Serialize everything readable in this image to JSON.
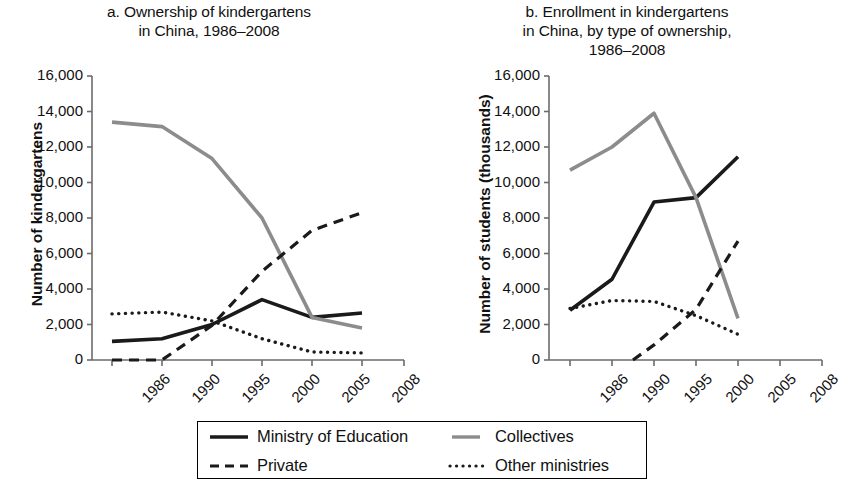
{
  "figure": {
    "background": "#ffffff",
    "colors": {
      "ministry_of_education": "#1a1a1a",
      "collectives": "#8c8c8c",
      "private": "#1a1a1a",
      "other_ministries": "#1a1a1a",
      "axis": "#6b6b6b",
      "text": "#111111"
    }
  },
  "legend": {
    "items": [
      {
        "label": "Ministry of Education",
        "style": "solid",
        "color": "#1a1a1a"
      },
      {
        "label": "Collectives",
        "style": "solid",
        "color": "#8c8c8c"
      },
      {
        "label": "Private",
        "style": "dashed",
        "color": "#1a1a1a"
      },
      {
        "label": "Other ministries",
        "style": "dotted",
        "color": "#1a1a1a"
      }
    ]
  },
  "chart_data": [
    {
      "type": "line",
      "panel": "a",
      "title": "a. Ownership of kindergartens\nin China, 1986–2008",
      "title_line1": "a. Ownership of kindergartens",
      "title_line2": "in China, 1986–2008",
      "xlabel": "",
      "ylabel": "Number of kindergartens",
      "x": [
        1986,
        1990,
        1995,
        2000,
        2005,
        2008
      ],
      "xtick_labels": [
        "1986",
        "1990",
        "1995",
        "2000",
        "2005",
        "2008"
      ],
      "ytick_labels": [
        "0",
        "2,000",
        "4,000",
        "6,000",
        "8,000",
        "10,000",
        "12,000",
        "14,000",
        "16,000"
      ],
      "ytick_values": [
        0,
        2000,
        4000,
        6000,
        8000,
        10000,
        12000,
        14000,
        16000
      ],
      "ylim": [
        0,
        16000
      ],
      "grid": false,
      "legend_position": "below-figure",
      "series": [
        {
          "name": "Ministry of Education",
          "style": "solid",
          "color": "#1a1a1a",
          "x": [
            1986,
            1990,
            1995,
            2000,
            2005,
            2008
          ],
          "values": [
            1050,
            1200,
            2000,
            3400,
            2400,
            2650
          ]
        },
        {
          "name": "Collectives",
          "style": "solid",
          "color": "#8c8c8c",
          "x": [
            1986,
            1990,
            1995,
            2000,
            2005,
            2008
          ],
          "values": [
            13400,
            13150,
            11350,
            8000,
            2400,
            1800
          ]
        },
        {
          "name": "Private",
          "style": "dashed",
          "color": "#1a1a1a",
          "x": [
            1986,
            1990,
            1995,
            2000,
            2005,
            2008
          ],
          "values": [
            0,
            0,
            1950,
            5000,
            7300,
            8300
          ]
        },
        {
          "name": "Other ministries",
          "style": "dotted",
          "color": "#1a1a1a",
          "x": [
            1986,
            1990,
            1995,
            2000,
            2005,
            2008
          ],
          "values": [
            2600,
            2700,
            2200,
            1200,
            450,
            400
          ]
        }
      ]
    },
    {
      "type": "line",
      "panel": "b",
      "title": "b. Enrollment in kindergartens\nin China, by type of ownership,\n1986–2008",
      "title_line1": "b. Enrollment in kindergartens",
      "title_line2": "in China, by type of ownership,",
      "title_line3": "1986–2008",
      "xlabel": "",
      "ylabel": "Number of students (thousands)",
      "x": [
        1986,
        1990,
        1995,
        2000,
        2005,
        2008
      ],
      "xtick_labels": [
        "1986",
        "1990",
        "1995",
        "2000",
        "2005",
        "2008"
      ],
      "ytick_labels": [
        "0",
        "2,000",
        "4,000",
        "6,000",
        "8,000",
        "10,000",
        "12,000",
        "14,000",
        "16,000"
      ],
      "ytick_values": [
        0,
        2000,
        4000,
        6000,
        8000,
        10000,
        12000,
        14000,
        16000
      ],
      "ylim": [
        0,
        16000
      ],
      "grid": false,
      "legend_position": "below-figure",
      "series": [
        {
          "name": "Ministry of Education",
          "style": "solid",
          "color": "#1a1a1a",
          "x": [
            1986,
            1990,
            1995,
            2000,
            2005
          ],
          "values": [
            2800,
            4550,
            8900,
            9150,
            11450
          ]
        },
        {
          "name": "Collectives",
          "style": "solid",
          "color": "#8c8c8c",
          "x": [
            1986,
            1990,
            1995,
            2000,
            2005
          ],
          "values": [
            10700,
            12000,
            13900,
            9150,
            2350
          ]
        },
        {
          "name": "Private",
          "style": "dashed",
          "color": "#1a1a1a",
          "x": [
            1992.5,
            1995,
            2000,
            2005
          ],
          "values": [
            0,
            850,
            2850,
            6700
          ]
        },
        {
          "name": "Other ministries",
          "style": "dotted",
          "color": "#1a1a1a",
          "x": [
            1986,
            1990,
            1995,
            2000,
            2005
          ],
          "values": [
            2900,
            3350,
            3300,
            2500,
            1450
          ]
        }
      ]
    }
  ]
}
